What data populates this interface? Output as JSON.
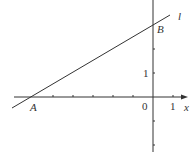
{
  "figure": {
    "type": "coordinate-plane-line",
    "axes": {
      "x_label": "x",
      "y_label": "y",
      "origin_label": "0",
      "x_unit_label": "1",
      "y_unit_label": "1"
    },
    "line": {
      "label": "l",
      "points": [
        {
          "label": "A",
          "x": -6,
          "y": 0
        },
        {
          "label": "B",
          "x": 0,
          "y": 3
        }
      ]
    },
    "x_ticks": [
      -6,
      -5,
      -4,
      -3,
      -2,
      -1,
      1
    ],
    "y_ticks": [
      -2,
      -1,
      1,
      2,
      3
    ],
    "colors": {
      "stroke": "#333333",
      "background": "#ffffff"
    }
  },
  "labels": {
    "A": "A",
    "B": "B",
    "l": "l",
    "x": "x",
    "zero": "0",
    "one_x": "1",
    "one_y": "1"
  }
}
